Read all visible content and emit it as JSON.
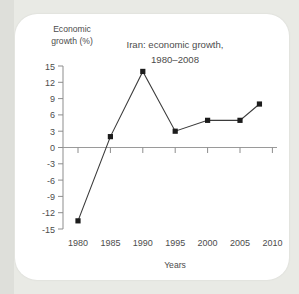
{
  "figure": {
    "title_line1": "Iran: economic growth,",
    "title_line2": "1980–2008",
    "y_axis_label_line1": "Economic",
    "y_axis_label_line2": "growth (%)",
    "x_axis_label": "Years"
  },
  "chart_data": {
    "type": "line",
    "title": "Iran: economic growth, 1980–2008",
    "xlabel": "Years",
    "ylabel": "Economic growth (%)",
    "x": [
      1980,
      1985,
      1990,
      1995,
      2000,
      2005,
      2008
    ],
    "values": [
      -13.5,
      2,
      14,
      3,
      5,
      5,
      8
    ],
    "series": [
      {
        "name": "Economic growth (%)",
        "points": [
          {
            "x": 1980,
            "y": -13.5
          },
          {
            "x": 1985,
            "y": 2
          },
          {
            "x": 1990,
            "y": 14
          },
          {
            "x": 1995,
            "y": 3
          },
          {
            "x": 2000,
            "y": 5
          },
          {
            "x": 2005,
            "y": 5
          },
          {
            "x": 2008,
            "y": 8
          }
        ]
      }
    ],
    "xlim": [
      1978.5,
      2011.5
    ],
    "ylim": [
      -15,
      15
    ],
    "xticks": [
      1980,
      1985,
      1990,
      1995,
      2000,
      2005,
      2010
    ],
    "xtick_labels": [
      "1980",
      "1985",
      "1990",
      "1995",
      "2000",
      "2005",
      "2010"
    ],
    "yticks": [
      15,
      12,
      9,
      6,
      3,
      0,
      -3,
      -6,
      -9,
      -12,
      -15
    ],
    "ytick_labels": [
      "15",
      "12",
      "9",
      "6",
      "3",
      "0",
      "-3",
      "-6",
      "-9",
      "-12",
      "-15"
    ],
    "grid": false,
    "legend": null,
    "marker": "square",
    "line_color": "#3b3b3b",
    "marker_color": "#1c1c1c",
    "axis_color": "#8d8d8d",
    "background_color": "#ffffff"
  }
}
